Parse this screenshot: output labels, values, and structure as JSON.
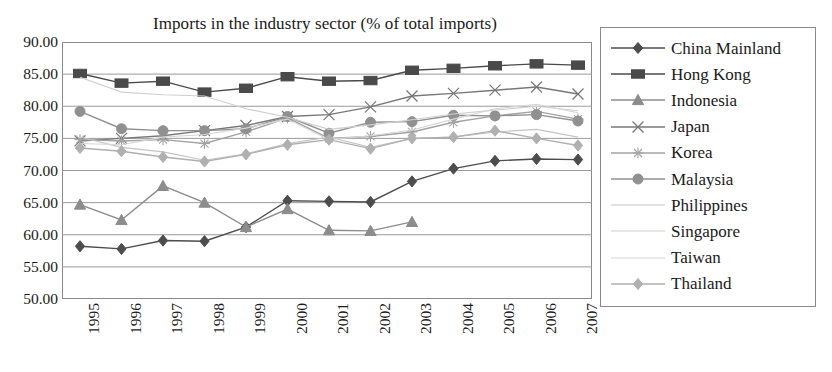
{
  "chart_data": {
    "type": "line",
    "title": "Imports in the industry sector (% of total imports)",
    "xlabel": "",
    "ylabel": "",
    "grid": true,
    "legend_position": "right",
    "ylim": [
      50.0,
      90.0
    ],
    "ytick_step": 5.0,
    "ytick_labels": [
      "90.00",
      "85.00",
      "80.00",
      "75.00",
      "70.00",
      "65.00",
      "60.00",
      "55.00",
      "50.00"
    ],
    "ytick_values": [
      90.0,
      85.0,
      80.0,
      75.0,
      70.0,
      65.0,
      60.0,
      55.0,
      50.0
    ],
    "categories": [
      "1995",
      "1996",
      "1997",
      "1998",
      "1999",
      "2000",
      "2001",
      "2002",
      "2003",
      "2004",
      "2005",
      "2006",
      "2007"
    ],
    "series": [
      {
        "name": "China Mainland",
        "marker": "diamond",
        "color": "#4d4d4d",
        "values": [
          58.2,
          57.8,
          59.1,
          59.0,
          61.2,
          65.3,
          65.2,
          65.1,
          68.3,
          70.3,
          71.5,
          71.8,
          71.7
        ]
      },
      {
        "name": "Hong Kong",
        "marker": "square",
        "color": "#4a4a4a",
        "values": [
          85.1,
          83.6,
          83.9,
          82.2,
          82.8,
          84.6,
          83.9,
          84.0,
          85.6,
          85.9,
          86.3,
          86.6,
          86.4
        ]
      },
      {
        "name": "Indonesia",
        "marker": "triangle",
        "color": "#8c8c8c",
        "values": [
          64.7,
          62.3,
          67.6,
          65.0,
          61.2,
          64.0,
          60.7,
          60.6,
          62.0,
          null,
          null,
          null,
          null
        ]
      },
      {
        "name": "Japan",
        "marker": "cross",
        "color": "#777777",
        "values": [
          74.6,
          75.0,
          75.4,
          76.2,
          77.0,
          78.4,
          78.7,
          79.9,
          81.6,
          82.0,
          82.5,
          83.0,
          81.9
        ]
      },
      {
        "name": "Korea",
        "marker": "star",
        "color": "#a3a3a3",
        "values": [
          74.8,
          74.6,
          74.8,
          74.2,
          76.0,
          78.2,
          75.0,
          75.3,
          76.0,
          77.5,
          78.5,
          79.2,
          78.0
        ]
      },
      {
        "name": "Malaysia",
        "marker": "circle",
        "color": "#909090",
        "values": [
          79.2,
          76.5,
          76.2,
          76.2,
          76.5,
          78.4,
          75.8,
          77.5,
          77.6,
          78.6,
          78.5,
          78.7,
          77.7
        ]
      },
      {
        "name": "Philippines",
        "marker": "line",
        "color": "#c4c4c4",
        "values": [
          75.2,
          73.6,
          72.9,
          71.6,
          72.6,
          74.2,
          75.2,
          73.6,
          75.0,
          75.2,
          76.0,
          76.4,
          75.2
        ]
      },
      {
        "name": "Singapore",
        "marker": "line",
        "color": "#cfcfcf",
        "values": [
          84.5,
          82.2,
          81.8,
          81.6,
          79.6,
          78.3,
          76.4,
          77.1,
          77.9,
          78.8,
          79.4,
          80.0,
          79.3
        ]
      },
      {
        "name": "Taiwan",
        "marker": "line",
        "color": "#d6d6d6",
        "values": [
          74.2,
          74.0,
          75.2,
          75.6,
          76.6,
          78.0,
          74.8,
          75.4,
          76.3,
          78.0,
          79.6,
          80.3,
          79.0
        ]
      },
      {
        "name": "Thailand",
        "marker": "diamond",
        "color": "#b0b0b0",
        "values": [
          73.5,
          73.0,
          72.1,
          71.4,
          72.5,
          74.0,
          74.8,
          73.4,
          75.0,
          75.2,
          76.2,
          75.0,
          73.9
        ]
      }
    ]
  }
}
